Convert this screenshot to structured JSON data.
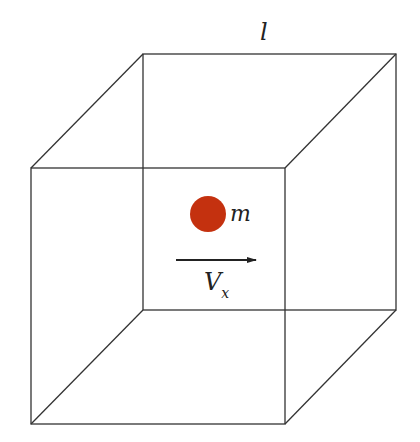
{
  "diagram": {
    "type": "cube-particle",
    "labels": {
      "edge_length": "l",
      "mass": "m",
      "velocity_main": "V",
      "velocity_sub": "x"
    },
    "colors": {
      "edge": "#333333",
      "particle": "#c4310f",
      "arrow": "#222222"
    },
    "cube": {
      "back_face": {
        "x1": 143,
        "y1": 54,
        "x2": 396,
        "y2": 310
      },
      "front_face": {
        "x1": 31,
        "y1": 168,
        "x2": 285,
        "y2": 424
      }
    },
    "particle": {
      "cx": 208,
      "cy": 214,
      "r": 18
    },
    "arrow": {
      "x1": 176,
      "y1": 260,
      "x2": 256,
      "y2": 260
    }
  }
}
